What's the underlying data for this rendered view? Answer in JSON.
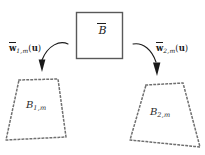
{
  "figure": {
    "type": "diagram",
    "background_color": "#ffffff",
    "width": 205,
    "height": 155
  },
  "source_box": {
    "label_base": "B",
    "label_accent": "overbar",
    "label_text": "B̄",
    "border_color": "#595959",
    "fill_color": "#ffffff",
    "x": 76,
    "y": 12,
    "width": 46,
    "height": 46
  },
  "mappings": [
    {
      "id": "left",
      "symbol": "w",
      "accent": "overbar",
      "subscript": "1,m",
      "argument": "u",
      "label_text": "w̄1,m(u)",
      "arrow_color": "#1a1a1a",
      "arrow_direction": "down-left"
    },
    {
      "id": "right",
      "symbol": "w",
      "accent": "overbar",
      "subscript": "2,m",
      "argument": "u",
      "label_text": "w̄2,m(u)",
      "arrow_color": "#1a1a1a",
      "arrow_direction": "down-right"
    }
  ],
  "regions": [
    {
      "id": "left",
      "label_base": "B",
      "subscript": "1,m",
      "label_text": "B1,m",
      "border_style": "dotted",
      "border_color": "#707070",
      "vertices": [
        [
          19,
          80
        ],
        [
          58,
          79
        ],
        [
          66,
          137
        ],
        [
          6,
          140
        ]
      ]
    },
    {
      "id": "right",
      "label_base": "B",
      "subscript": "2,m",
      "label_text": "B2,m",
      "border_style": "dotted",
      "border_color": "#707070",
      "vertices": [
        [
          146,
          85
        ],
        [
          183,
          83
        ],
        [
          200,
          147
        ],
        [
          130,
          140
        ]
      ]
    }
  ],
  "colors": {
    "text": "#1a1a1a",
    "box_border": "#595959",
    "region_border": "#707070",
    "arrow": "#1a1a1a",
    "background": "#ffffff"
  }
}
